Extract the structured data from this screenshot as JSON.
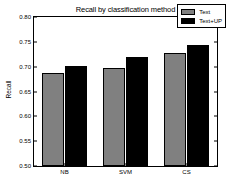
{
  "chart_data": {
    "type": "bar",
    "title": "Recall by classification method",
    "xlabel": "",
    "ylabel": "Recall",
    "categories": [
      "NB",
      "SVM",
      "CS"
    ],
    "series": [
      {
        "name": "Text",
        "color": "#808080",
        "values": [
          0.688,
          0.698,
          0.727
        ]
      },
      {
        "name": "Text+UP",
        "color": "#000000",
        "values": [
          0.702,
          0.72,
          0.743
        ]
      }
    ],
    "ylim": [
      0.5,
      0.8
    ],
    "yticks": [
      0.5,
      0.55,
      0.6,
      0.65,
      0.7,
      0.75,
      0.8
    ],
    "ytick_labels": [
      "0.50",
      "0.55",
      "0.60",
      "0.65",
      "0.70",
      "0.75",
      "0.80"
    ],
    "grid": false,
    "legend_position": "top-right"
  },
  "legend": {
    "entries": [
      {
        "label": "Text"
      },
      {
        "label": "Text+UP"
      }
    ]
  }
}
